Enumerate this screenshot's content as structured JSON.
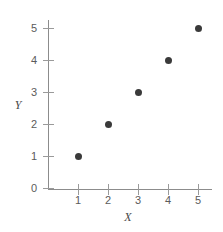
{
  "chart_data": {
    "type": "scatter",
    "title": "",
    "xlabel": "X",
    "ylabel": "Y",
    "x": [
      1,
      2,
      3,
      4,
      5
    ],
    "y": [
      1,
      2,
      3,
      4,
      5
    ],
    "points": [
      {
        "x": 1,
        "y": 1
      },
      {
        "x": 2,
        "y": 2
      },
      {
        "x": 3,
        "y": 3
      },
      {
        "x": 4,
        "y": 4
      },
      {
        "x": 5,
        "y": 5
      }
    ],
    "xlim": [
      0,
      5.5
    ],
    "ylim": [
      0,
      5.4
    ],
    "xticks": [
      1,
      2,
      3,
      4,
      5
    ],
    "yticks": [
      0,
      1,
      2,
      3,
      4,
      5
    ],
    "xtick_labels": [
      "1",
      "2",
      "3",
      "4",
      "5"
    ],
    "ytick_labels": [
      "0",
      "1",
      "2",
      "3",
      "4",
      "5"
    ],
    "grid": false,
    "legend": null,
    "marker_color": "#3a3a3a",
    "axis_color": "#8c8c8c",
    "tick_color": "#9a9a9a",
    "label_color": "#5b5b5b"
  }
}
